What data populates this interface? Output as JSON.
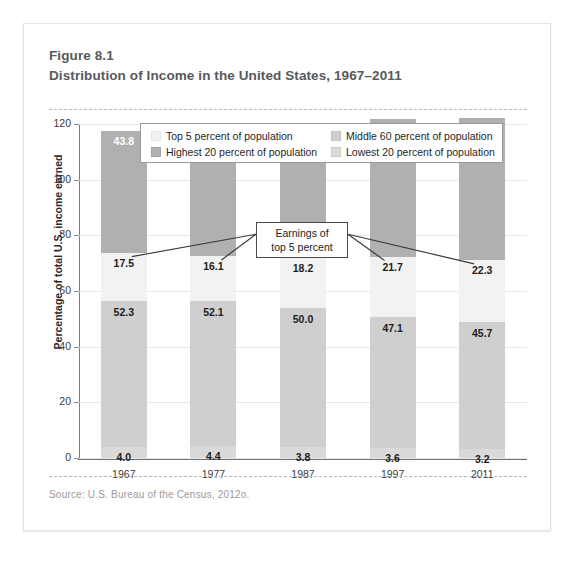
{
  "figure": {
    "number": "Figure 8.1",
    "title": "Distribution of Income in the United States, 1967–2011",
    "source": "Source:  U.S. Bureau of the Census, 2012o."
  },
  "annotation": {
    "line1": "Earnings of",
    "line2": "top 5 percent"
  },
  "colors": {
    "top5": "#f2f2f2",
    "highest20": "#b0b0b0",
    "middle60": "#cfcfcf",
    "lowest20": "#d9d9d9",
    "axis": "#6e6e6e",
    "grid": "#e8e8e8",
    "card_border": "#e3e3e3",
    "title_text": "#58595b",
    "source_text": "#9a9a9a"
  },
  "chart_data": {
    "type": "bar",
    "title": "Distribution of Income in the United States, 1967–2011",
    "subtitle": "Figure 8.1",
    "xlabel": "",
    "ylabel": "Percentage of total U.S. income earned",
    "ylim": [
      0,
      120
    ],
    "yticks": [
      0,
      20,
      40,
      60,
      80,
      100,
      120
    ],
    "grid": true,
    "stacked": true,
    "legend_position": "top-inside",
    "categories": [
      "1967",
      "1977",
      "1987",
      "1997",
      "2011"
    ],
    "series": [
      {
        "name": "Lowest 20 percent of population",
        "color": "#d9d9d9",
        "values": [
          4.0,
          4.4,
          3.8,
          3.6,
          3.2
        ],
        "labels": [
          "4.0",
          "4.4",
          "3.8",
          "3.6",
          "3.2"
        ]
      },
      {
        "name": "Middle 60 percent of population",
        "color": "#cfcfcf",
        "values": [
          52.3,
          52.1,
          50.0,
          47.1,
          45.7
        ],
        "labels": [
          "52.3",
          "52.1",
          "50.0",
          "47.1",
          "45.7"
        ]
      },
      {
        "name": "Top 5 percent of population",
        "color": "#f2f2f2",
        "values": [
          17.5,
          16.1,
          18.2,
          21.7,
          22.3
        ],
        "labels": [
          "17.5",
          "16.1",
          "18.2",
          "21.7",
          "22.3"
        ]
      },
      {
        "name": "Highest 20 percent of population",
        "color": "#b0b0b0",
        "values": [
          43.8,
          43.6,
          46.2,
          49.4,
          51.1
        ],
        "labels": [
          "43.8",
          "43.6",
          "46.2",
          "49.4",
          "51.1"
        ]
      }
    ],
    "annotations": [
      {
        "text": "Earnings of top 5 percent",
        "points_to_series": "Top 5 percent of population"
      }
    ]
  },
  "legend": {
    "items": [
      {
        "label": "Top 5 percent of population",
        "color": "#f2f2f2"
      },
      {
        "label": "Highest 20 percent of population",
        "color": "#b0b0b0"
      },
      {
        "label": "Middle 60 percent of population",
        "color": "#cfcfcf"
      },
      {
        "label": "Lowest 20 percent of population",
        "color": "#d9d9d9"
      }
    ]
  }
}
